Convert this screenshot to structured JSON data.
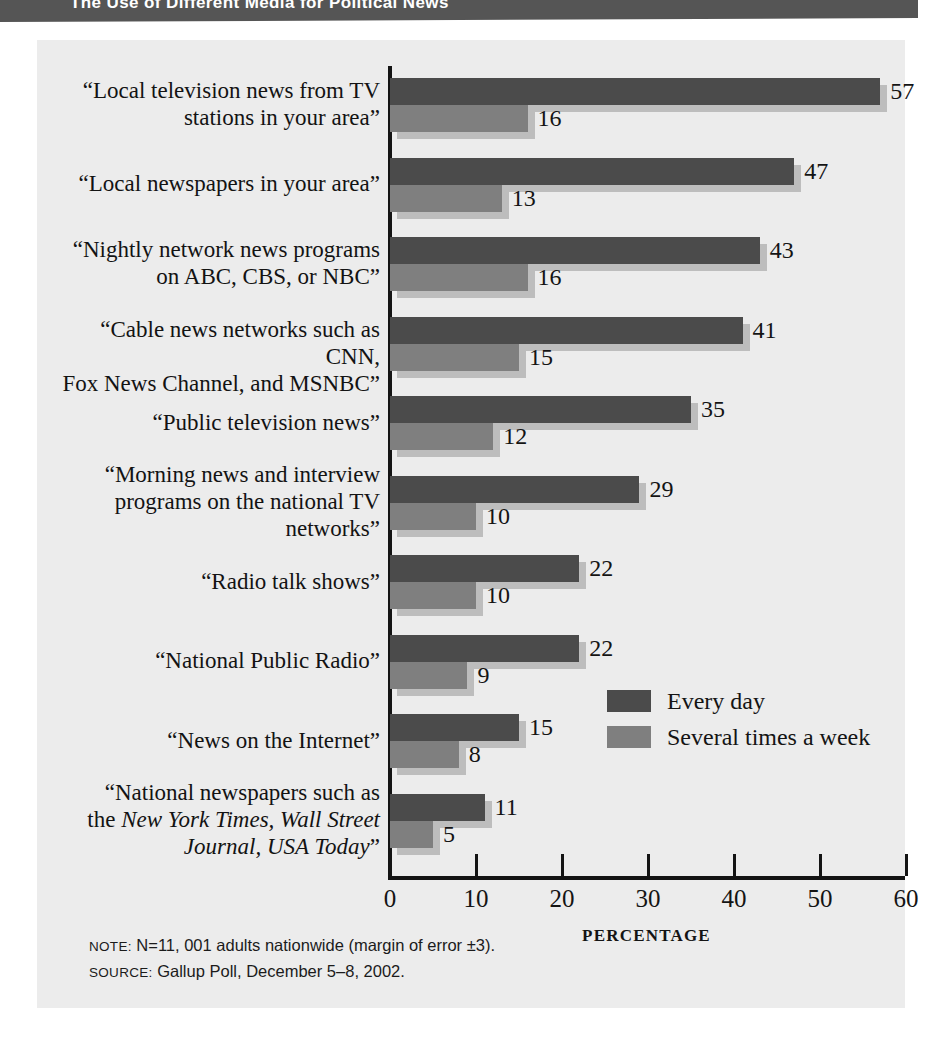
{
  "header": {
    "title": "The Use of Different Media for Political News"
  },
  "footer": {
    "note_key": "NOTE:",
    "note_text": " N=11, 001 adults nationwide (margin of error ±3).",
    "source_key": "SOURCE:",
    "source_text": " Gallup Poll, December 5–8, 2002."
  },
  "legend": {
    "position": "inside-right",
    "entries": [
      {
        "label": "Every day",
        "color": "#4b4b4b"
      },
      {
        "label": "Several times a week",
        "color": "#7f7f7f"
      }
    ]
  },
  "chart_data": {
    "type": "bar",
    "orientation": "horizontal",
    "title": "The Use of Different Media for Political News",
    "xlabel": "PERCENTAGE",
    "ylabel": "",
    "xlim": [
      0,
      60
    ],
    "xticks": [
      0,
      10,
      20,
      30,
      40,
      50,
      60
    ],
    "xticklabels": [
      "0",
      "10",
      "20",
      "30",
      "40",
      "50",
      "60"
    ],
    "grid": false,
    "categories": [
      "“Local television news from TV stations in your area”",
      "“Local newspapers in your area”",
      "“Nightly network news programs on ABC, CBS,  or NBC”",
      "“Cable news networks such as CNN, Fox News Channel, and MSNBC”",
      "“Public television news”",
      "“Morning news and interview programs on the national TV networks”",
      "“Radio talk shows”",
      "“National Public Radio”",
      "“News on the Internet”",
      "“National newspapers such as the New York Times, Wall Street Journal, USA Today”"
    ],
    "series": [
      {
        "name": "Every day",
        "color": "#4b4b4b",
        "values": [
          57,
          47,
          43,
          41,
          35,
          29,
          22,
          22,
          15,
          11
        ]
      },
      {
        "name": "Several times a week",
        "color": "#7f7f7f",
        "values": [
          16,
          13,
          16,
          15,
          12,
          10,
          10,
          9,
          8,
          5
        ]
      }
    ]
  },
  "category_label_lines": [
    [
      "“Local television news from TV",
      "stations in your area”"
    ],
    [
      "“Local newspapers in your area”"
    ],
    [
      "“Nightly network news programs",
      "on ABC, CBS,  or NBC”"
    ],
    [
      "“Cable news networks such as CNN,",
      "Fox News Channel, and MSNBC”"
    ],
    [
      "“Public television news”"
    ],
    [
      "“Morning news and interview",
      "programs on the national TV",
      "networks”"
    ],
    [
      "“Radio talk shows”"
    ],
    [
      "“National Public Radio”"
    ],
    [
      "“News on the Internet”"
    ],
    [
      "“National newspapers such as",
      "the |New York Times, Wall Street|",
      "|Journal, USA Today|”"
    ]
  ],
  "colors": {
    "panel_background": "#ececec",
    "title_bar": "#555555",
    "axis": "#141414",
    "bar_shadow": "#bdbdbd"
  }
}
